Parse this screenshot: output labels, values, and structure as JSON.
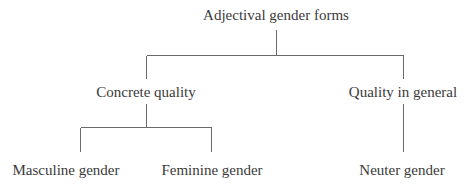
{
  "diagram": {
    "type": "tree",
    "root": {
      "label": "Adjectival gender forms",
      "children": [
        {
          "label": "Concrete quality",
          "children": [
            {
              "label": "Masculine gender"
            },
            {
              "label": "Feminine gender"
            }
          ]
        },
        {
          "label": "Quality in general",
          "children": [
            {
              "label": "Neuter gender"
            }
          ]
        }
      ]
    },
    "colors": {
      "text": "#3a3a3a",
      "lines": "#6a6a6a",
      "background": "#ffffff"
    }
  }
}
